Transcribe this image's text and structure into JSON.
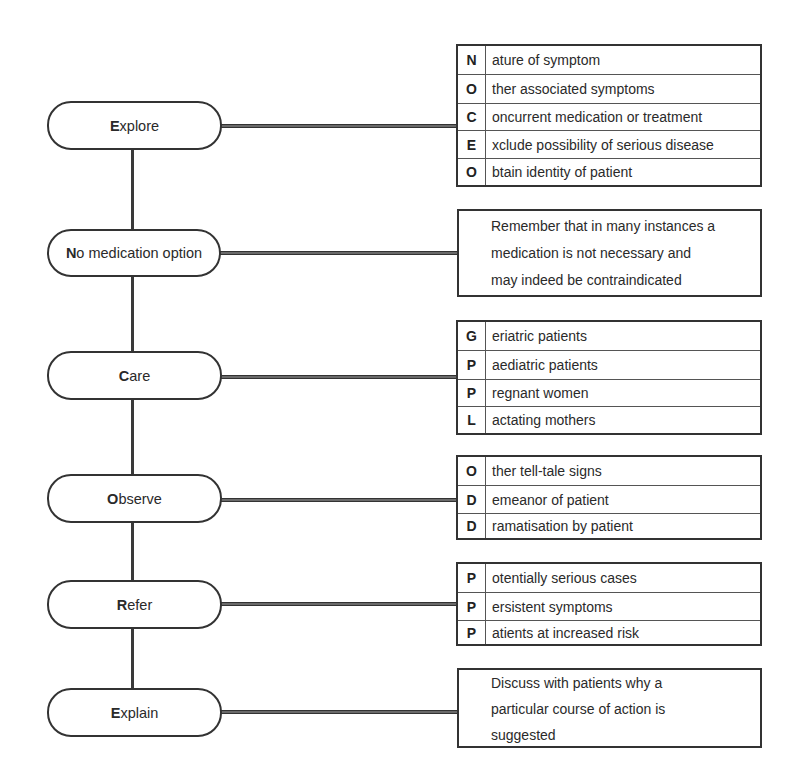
{
  "diagram": {
    "type": "flowchart",
    "acronym": "ENCORE",
    "steps": [
      {
        "id": "explore",
        "initial": "E",
        "rest": "xplore",
        "label": "Explore",
        "detail_type": "acronym",
        "detail_acronym": "NOCEO",
        "details": [
          {
            "letter": "N",
            "text": "ature of symptom"
          },
          {
            "letter": "O",
            "text": "ther associated symptoms"
          },
          {
            "letter": "C",
            "text": "oncurrent medication or treatment"
          },
          {
            "letter": "E",
            "text": "xclude possibility of serious disease"
          },
          {
            "letter": "O",
            "text": "btain identity of patient"
          }
        ]
      },
      {
        "id": "no-medication",
        "initial": "N",
        "rest": "o medication option",
        "label": "No medication option",
        "detail_type": "note",
        "note_lines": [
          "Remember that in many instances a",
          "medication is not necessary and",
          "may indeed be contraindicated"
        ]
      },
      {
        "id": "care",
        "initial": "C",
        "rest": "are",
        "label": "Care",
        "detail_type": "acronym",
        "detail_acronym": "GPPL",
        "details": [
          {
            "letter": "G",
            "text": "eriatric patients"
          },
          {
            "letter": "P",
            "text": "aediatric patients"
          },
          {
            "letter": "P",
            "text": "regnant women"
          },
          {
            "letter": "L",
            "text": "actating mothers"
          }
        ]
      },
      {
        "id": "observe",
        "initial": "O",
        "rest": "bserve",
        "label": "Observe",
        "detail_type": "acronym",
        "detail_acronym": "ODD",
        "details": [
          {
            "letter": "O",
            "text": "ther tell-tale signs"
          },
          {
            "letter": "D",
            "text": "emeanor of patient"
          },
          {
            "letter": "D",
            "text": "ramatisation by patient"
          }
        ]
      },
      {
        "id": "refer",
        "initial": "R",
        "rest": "efer",
        "label": "Refer",
        "detail_type": "acronym",
        "detail_acronym": "PPP",
        "details": [
          {
            "letter": "P",
            "text": "otentially serious cases"
          },
          {
            "letter": "P",
            "text": "ersistent symptoms"
          },
          {
            "letter": "P",
            "text": "atients at increased risk"
          }
        ]
      },
      {
        "id": "explain",
        "initial": "E",
        "rest": "xplain",
        "label": "Explain",
        "detail_type": "note",
        "note_lines": [
          "Discuss with patients why a",
          "particular course of action is",
          "suggested"
        ]
      }
    ]
  },
  "colors": {
    "line": "#333333",
    "connector_fill": "#6a6a6a",
    "text": "#2a2a2a",
    "background": "#ffffff"
  }
}
